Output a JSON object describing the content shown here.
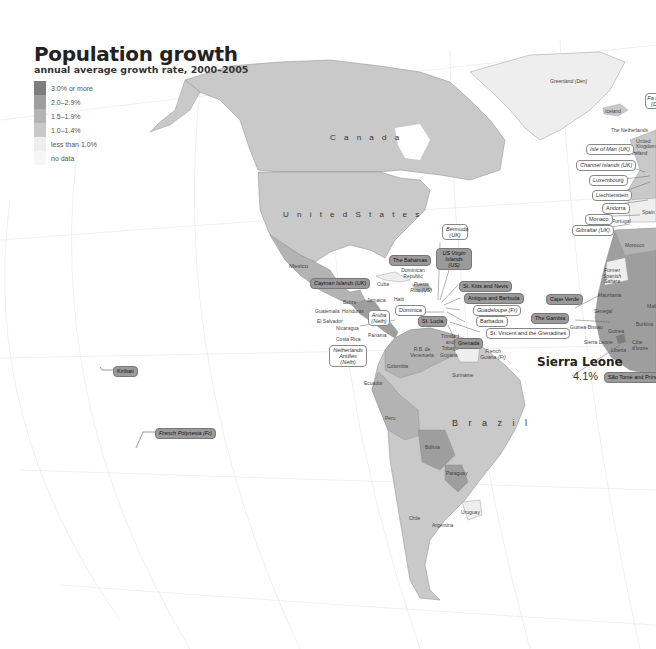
{
  "title": "Population growth",
  "subtitle": "annual average growth rate, 2000–2005",
  "legend": [
    {
      "label": "3.0% or more",
      "color": "#7d7d7d"
    },
    {
      "label": "2.0–2.9%",
      "color": "#9e9e9e"
    },
    {
      "label": "1.5–1.9%",
      "color": "#b3b3b3"
    },
    {
      "label": "1.0–1.4%",
      "color": "#c9c9c9"
    },
    {
      "label": "less than 1.0%",
      "color": "#eeeeee"
    },
    {
      "label": "no data",
      "color": "#f6f6f6"
    }
  ],
  "colors": {
    "land_low": "#c9c9c9",
    "land_mid": "#b3b3b3",
    "land_high": "#9e9e9e",
    "land_top": "#7d7d7d",
    "land_lt1": "#eeeeee",
    "graticule": "#e6e6e6",
    "border": "#8a8a8a"
  },
  "countries": {
    "canada": "C a n a d a",
    "united_states": "U n i t e d   S t a t e s",
    "mexico": "Mexico",
    "brazil": "B r a z i l",
    "greenland": "Greenland (Den)",
    "iceland": "Iceland",
    "netherlands": "The Netherlands",
    "united_kingdom": "United Kingdom",
    "ireland": "Ireland",
    "spain": "Spain",
    "portugal": "Portugal",
    "morocco": "Morocco",
    "former_spanish_sahara": "Former Spanish Sahara",
    "mauritania": "Mauritania",
    "mali": "Mali",
    "senegal": "Senegal",
    "guinea_bissau": "Guinea-Bissau",
    "guinea": "Guinea",
    "sierra_leone": "Sierra Leone",
    "liberia": "Liberia",
    "cote_divoire": "Côte d'Ivoire",
    "burkina": "Burkina",
    "cuba": "Cuba",
    "jamaica": "Jamaica",
    "haiti": "Haiti",
    "dominican_republic": "Dominican Republic",
    "puerto_rico": "Puerto Rico (US)",
    "belize": "Belize",
    "guatemala": "Guatemala",
    "honduras": "Honduras",
    "el_salvador": "El Salvador",
    "nicaragua": "Nicaragua",
    "costa_rica": "Costa Rica",
    "panama": "Panama",
    "trinidad": "Trinidad and Tobago",
    "venezuela": "R.B. de Venezuela",
    "guyana": "Guyana",
    "suriname": "Suriname",
    "french_guiana": "French Guiana (Fr)",
    "colombia": "Colombia",
    "ecuador": "Ecuador",
    "peru": "Peru",
    "bolivia": "Bolivia",
    "paraguay": "Paraguay",
    "chile": "Chile",
    "argentina": "Argentina",
    "uruguay": "Uruguay"
  },
  "tags": {
    "faroe": "Fa Isl (D",
    "isle_of_man": "Isle of Man (UK)",
    "channel_islands": "Channel Islands (UK)",
    "luxembourg": "Luxembourg",
    "liechtenstein": "Liechtenstein",
    "andorra": "Andorra",
    "monaco": "Monaco",
    "gibraltar": "Gibraltar (UK)",
    "bermuda": "Bermuda (UK)",
    "us_virgin": "US Virgin Islands (US)",
    "bahamas": "The Bahamas",
    "cayman": "Cayman Islands (UK)",
    "st_kitts": "St. Kitts and Nevis",
    "antigua": "Antigua and Barbuda",
    "guadeloupe": "Guadeloupe (Fr)",
    "barbados": "Barbados",
    "dominica": "Dominica",
    "st_lucia": "St. Lucia",
    "st_vincent": "St. Vincent and the Grenadines",
    "grenada": "Grenada",
    "aruba": "Aruba (Neth)",
    "netherlands_antilles": "Netherlands Antilles (Neth)",
    "cape_verde": "Cape Verde",
    "gambia": "The Gambia",
    "sao_tome": "São Tomé and Prínc",
    "kiribati": "Kiribati",
    "french_polynesia": "French Polynesia (Fr)"
  },
  "callout": {
    "name": "Sierra Leone",
    "value": "4.1%"
  }
}
